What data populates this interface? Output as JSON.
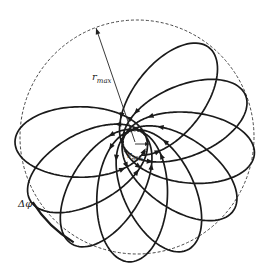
{
  "figure": {
    "colors": {
      "ink": "#1a1a1a",
      "background": "#ffffff",
      "dashed": "#333333"
    }
  },
  "geometry": {
    "center": [
      135,
      142
    ],
    "outer_circle": {
      "cx": 137,
      "cy": 137,
      "r": 117
    },
    "inner_circle": {
      "cx": 135,
      "cy": 144,
      "r": 13
    },
    "r_max": 120,
    "r_min": 12,
    "r_max_tip": [
      96,
      28
    ],
    "r_min_tip": [
      149,
      144
    ],
    "first_apocenter_deg": 52,
    "apsidal_step_deg": -29,
    "num_loops": 9,
    "direction": "counterclockwise"
  },
  "labels": {
    "r_max": {
      "main": "r",
      "sub": "max",
      "x": 92,
      "y": 80
    },
    "r_min": {
      "main": "r",
      "sub": "min",
      "x": 127,
      "y": 158
    },
    "delta_phi": {
      "text": "Δφ",
      "x": 18,
      "y": 207
    }
  },
  "delta_phi_arc": {
    "from_deg": 148,
    "to_deg": 121,
    "r": 123
  }
}
